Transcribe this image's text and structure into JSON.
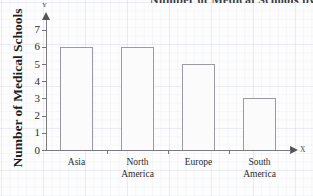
{
  "chart_data": {
    "type": "bar",
    "title": "Number of Medical Schools by Continent",
    "xlabel": "X",
    "ylabel": "Number of Medical Schools",
    "categories": [
      "Asia",
      "North America",
      "Europe",
      "South America"
    ],
    "values": [
      6,
      6,
      5,
      3
    ],
    "ylim": [
      0,
      7
    ],
    "ytick_labels": [
      "0",
      "1",
      "2",
      "3",
      "4",
      "5",
      "6",
      "7"
    ],
    "ytick_values": [
      0,
      1,
      2,
      3,
      4,
      5,
      6,
      7
    ],
    "grid": true,
    "legend": false,
    "axis_letter_x": "X",
    "axis_letter_y": "Y",
    "bar_fill_color": "#fbfbfb",
    "bar_border_color": "#9a9aa0",
    "axis_color": "#7b7b80"
  },
  "category_lines": [
    [
      "Asia"
    ],
    [
      "North",
      "America"
    ],
    [
      "Europe"
    ],
    [
      "South",
      "America"
    ]
  ]
}
